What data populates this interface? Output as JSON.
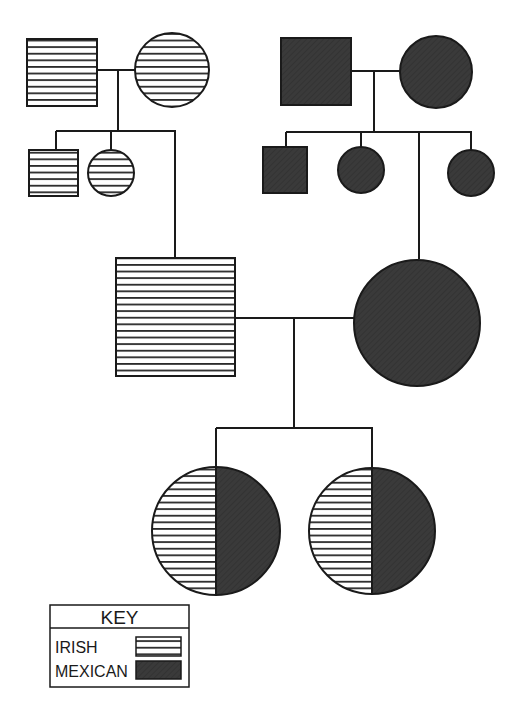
{
  "diagram": {
    "type": "pedigree-chart",
    "colors": {
      "irish_stripe": "#2a2a2a",
      "irish_bg": "#ffffff",
      "mexican_fill": "#3a3a3a",
      "outline": "#1a1a1a"
    },
    "generations": [
      {
        "level": 1,
        "families": [
          {
            "side": "paternal",
            "members": [
              {
                "id": "pgf",
                "sex": "male",
                "shape": "square",
                "ancestry": "irish"
              },
              {
                "id": "pgm",
                "sex": "female",
                "shape": "circle",
                "ancestry": "irish"
              }
            ]
          },
          {
            "side": "maternal",
            "members": [
              {
                "id": "mgf",
                "sex": "male",
                "shape": "square",
                "ancestry": "mexican"
              },
              {
                "id": "mgm",
                "sex": "female",
                "shape": "circle",
                "ancestry": "mexican"
              }
            ]
          }
        ]
      },
      {
        "level": 2,
        "members": [
          {
            "id": "p-sib1",
            "sex": "male",
            "shape": "square",
            "ancestry": "irish"
          },
          {
            "id": "p-sib2",
            "sex": "female",
            "shape": "circle",
            "ancestry": "irish"
          },
          {
            "id": "m-sib1",
            "sex": "male",
            "shape": "square",
            "ancestry": "mexican"
          },
          {
            "id": "m-sib2",
            "sex": "female",
            "shape": "circle",
            "ancestry": "mexican"
          },
          {
            "id": "m-sib3",
            "sex": "female",
            "shape": "circle",
            "ancestry": "mexican"
          }
        ]
      },
      {
        "level": 3,
        "members": [
          {
            "id": "father",
            "sex": "male",
            "shape": "square",
            "ancestry": "irish"
          },
          {
            "id": "mother",
            "sex": "female",
            "shape": "circle",
            "ancestry": "mexican"
          }
        ]
      },
      {
        "level": 4,
        "members": [
          {
            "id": "daughter1",
            "sex": "female",
            "shape": "circle",
            "ancestry": "half irish / half mexican"
          },
          {
            "id": "daughter2",
            "sex": "female",
            "shape": "circle",
            "ancestry": "half irish / half mexican"
          }
        ]
      }
    ]
  },
  "key": {
    "title": "KEY",
    "entries": [
      {
        "label": "IRISH",
        "pattern": "horizontal-stripes"
      },
      {
        "label": "MEXICAN",
        "pattern": "solid-dark"
      }
    ]
  }
}
